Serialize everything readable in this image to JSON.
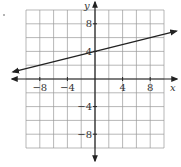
{
  "chart_data": {
    "type": "line",
    "title": "",
    "xlabel": "x",
    "ylabel": "y",
    "xlim": [
      -10,
      10
    ],
    "ylim": [
      -10,
      10
    ],
    "grid": true,
    "grid_step": 2,
    "xticks": [
      -8,
      -4,
      4,
      8
    ],
    "yticks": [
      8,
      4,
      -4,
      -8
    ],
    "xtick_labels": [
      "−8",
      "−4",
      "4",
      "8"
    ],
    "ytick_labels": [
      "8",
      "4",
      "−4",
      "−8"
    ],
    "series": [
      {
        "name": "line",
        "equation": "y = (1/4)x + 4",
        "slope": 0.25,
        "intercept": 4,
        "points": [
          [
            -8,
            2
          ],
          [
            0,
            4
          ],
          [
            8,
            6
          ]
        ],
        "arrows_both_ends": true
      }
    ],
    "colors": {
      "axis": "#222222",
      "grid": "#999999",
      "line": "#222222"
    }
  }
}
